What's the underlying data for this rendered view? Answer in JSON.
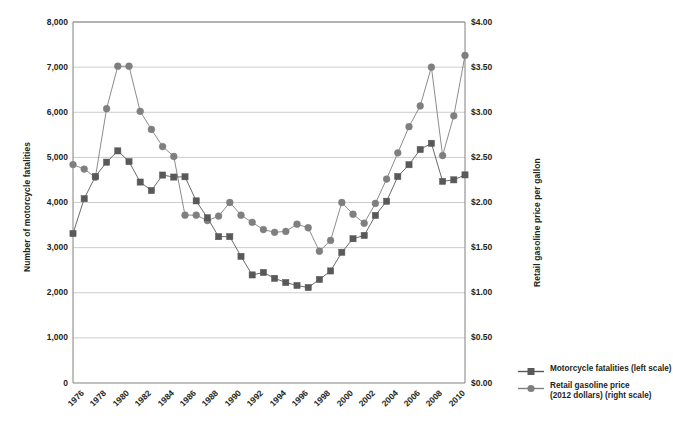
{
  "chart_data": {
    "type": "line",
    "title": "",
    "xlabel": "",
    "ylabel": "Number of motorcycle fatalities",
    "y2label": "Retail gasoline price per gallon",
    "grid": true,
    "legend_position": "right-bottom",
    "x": [
      1976,
      1977,
      1978,
      1979,
      1980,
      1981,
      1982,
      1983,
      1984,
      1985,
      1986,
      1987,
      1988,
      1989,
      1990,
      1991,
      1992,
      1993,
      1994,
      1995,
      1996,
      1997,
      1998,
      1999,
      2000,
      2001,
      2002,
      2003,
      2004,
      2005,
      2006,
      2007,
      2008,
      2009,
      2010,
      2011
    ],
    "xtick_labels": [
      "1976",
      "1978",
      "1980",
      "1982",
      "1984",
      "1986",
      "1988",
      "1990",
      "1992",
      "1994",
      "1996",
      "1998",
      "2000",
      "2002",
      "2004",
      "2006",
      "2008",
      "2010"
    ],
    "ylim": [
      0,
      8000
    ],
    "ytick_labels": [
      "0",
      "1,000",
      "2,000",
      "3,000",
      "4,000",
      "5,000",
      "6,000",
      "7,000",
      "8,000"
    ],
    "ytick_values": [
      0,
      1000,
      2000,
      3000,
      4000,
      5000,
      6000,
      7000,
      8000
    ],
    "y2lim": [
      0,
      4.0
    ],
    "y2tick_labels": [
      "$0.00",
      "$0.50",
      "$1.00",
      "$1.50",
      "$2.00",
      "$2.50",
      "$3.00",
      "$3.50",
      "$4.00"
    ],
    "y2tick_values": [
      0,
      0.5,
      1.0,
      1.5,
      2.0,
      2.5,
      3.0,
      3.5,
      4.0
    ],
    "series": [
      {
        "name": "Motorcycle fatalities (left scale)",
        "legend_label": "Motorcycle fatalities (left scale)",
        "axis": "left",
        "marker": "square",
        "color": "#595959",
        "values": [
          3312,
          4085,
          4577,
          4894,
          5144,
          4906,
          4453,
          4265,
          4608,
          4564,
          4570,
          4036,
          3662,
          3243,
          3244,
          2806,
          2395,
          2449,
          2320,
          2227,
          2161,
          2116,
          2294,
          2483,
          2897,
          3197,
          3270,
          3714,
          4028,
          4576,
          4837,
          5174,
          5312,
          4469,
          4502,
          4612
        ]
      },
      {
        "name": "Retail gasoline price (2012 dollars) (right scale)",
        "legend_label_line1": "Retail gasoline price",
        "legend_label_line2": "(2012 dollars) (right scale)",
        "axis": "right",
        "marker": "circle",
        "color": "#7f7f7f",
        "values": [
          2.42,
          2.37,
          2.28,
          3.04,
          3.51,
          3.51,
          3.01,
          2.81,
          2.62,
          2.51,
          1.86,
          1.86,
          1.8,
          1.85,
          2.0,
          1.86,
          1.78,
          1.7,
          1.67,
          1.68,
          1.76,
          1.72,
          1.46,
          1.58,
          2.0,
          1.87,
          1.77,
          1.99,
          2.26,
          2.55,
          2.84,
          3.07,
          3.5,
          2.52,
          2.96,
          3.63
        ]
      }
    ]
  },
  "axes": {
    "left_title": "Number of motorcycle fatalities",
    "right_title": "Retail gasoline price per gallon"
  },
  "legend": {
    "items": [
      {
        "label": "Motorcycle fatalities (left scale)",
        "marker": "square-line-key",
        "color": "#595959"
      },
      {
        "label_line1": "Retail gasoline price",
        "label_line2": "(2012 dollars) (right scale)",
        "marker": "circle-line-key",
        "color": "#7f7f7f"
      }
    ]
  },
  "colors": {
    "fatalities": "#595959",
    "gasoline": "#7f7f7f",
    "grid": "#bfbfbf",
    "frame": "#808080",
    "text": "#231f20"
  }
}
